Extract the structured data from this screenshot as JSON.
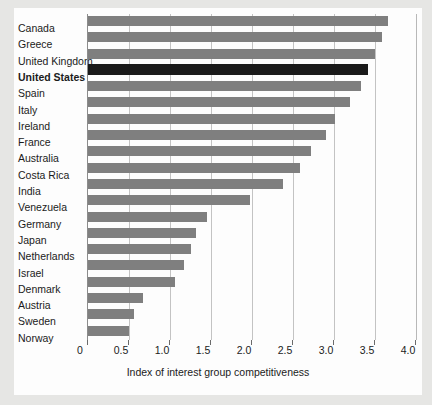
{
  "chart_data": {
    "type": "bar",
    "orientation": "horizontal",
    "title": "",
    "xlabel": "Index of interest group competitiveness",
    "ylabel": "",
    "xlim": [
      0,
      4.0
    ],
    "xticks": [
      "0",
      "0.5",
      "1.0",
      "1.5",
      "2.0",
      "2.5",
      "3.0",
      "3.5",
      "4.0"
    ],
    "xtick_values": [
      0,
      0.5,
      1.0,
      1.5,
      2.0,
      2.5,
      3.0,
      3.5,
      4.0
    ],
    "grid": true,
    "legend": false,
    "categories": [
      "Canada",
      "Greece",
      "United Kingdom",
      "United States",
      "Spain",
      "Italy",
      "Ireland",
      "France",
      "Australia",
      "Costa Rica",
      "India",
      "Venezuela",
      "Germany",
      "Japan",
      "Netherlands",
      "Israel",
      "Denmark",
      "Austria",
      "Sweden",
      "Norway"
    ],
    "values": [
      3.66,
      3.58,
      3.5,
      3.41,
      3.33,
      3.19,
      3.01,
      2.9,
      2.72,
      2.59,
      2.38,
      1.97,
      1.45,
      1.32,
      1.25,
      1.17,
      1.06,
      0.67,
      0.56,
      0.5
    ],
    "highlighted_category": "United States",
    "bars": [
      {
        "label": "Canada",
        "value": 3.66,
        "highlight": false
      },
      {
        "label": "Greece",
        "value": 3.58,
        "highlight": false
      },
      {
        "label": "United Kingdom",
        "value": 3.5,
        "highlight": false
      },
      {
        "label": "United States",
        "value": 3.41,
        "highlight": true
      },
      {
        "label": "Spain",
        "value": 3.33,
        "highlight": false
      },
      {
        "label": "Italy",
        "value": 3.19,
        "highlight": false
      },
      {
        "label": "Ireland",
        "value": 3.01,
        "highlight": false
      },
      {
        "label": "France",
        "value": 2.9,
        "highlight": false
      },
      {
        "label": "Australia",
        "value": 2.72,
        "highlight": false
      },
      {
        "label": "Costa Rica",
        "value": 2.59,
        "highlight": false
      },
      {
        "label": "India",
        "value": 2.38,
        "highlight": false
      },
      {
        "label": "Venezuela",
        "value": 1.97,
        "highlight": false
      },
      {
        "label": "Germany",
        "value": 1.45,
        "highlight": false
      },
      {
        "label": "Japan",
        "value": 1.32,
        "highlight": false
      },
      {
        "label": "Netherlands",
        "value": 1.25,
        "highlight": false
      },
      {
        "label": "Israel",
        "value": 1.17,
        "highlight": false
      },
      {
        "label": "Denmark",
        "value": 1.06,
        "highlight": false
      },
      {
        "label": "Austria",
        "value": 0.67,
        "highlight": false
      },
      {
        "label": "Sweden",
        "value": 0.56,
        "highlight": false
      },
      {
        "label": "Norway",
        "value": 0.5,
        "highlight": false
      }
    ],
    "colors": {
      "bar": "#7f7f7f",
      "highlight_bar": "#1a1a1a",
      "gridline": "#c3c3c3",
      "axis": "#8c8c8c",
      "text": "#1b1b1b",
      "plot_background": "#fdfdfd",
      "page_background": "#e6e6e4"
    }
  }
}
